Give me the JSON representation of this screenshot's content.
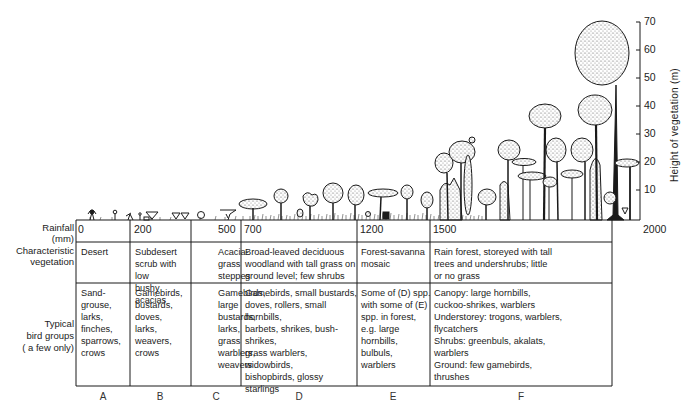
{
  "diagram": {
    "axis": {
      "title": "Height of vegetation (m)",
      "ticks": [
        "10",
        "20",
        "30",
        "40",
        "50",
        "60",
        "70"
      ],
      "unit": "m"
    },
    "row_labels": {
      "rainfall": "Rainfall\n(mm)",
      "vegetation": "Characteristic\nvegetation",
      "birds": "Typical\nbird groups\n( a few only)"
    },
    "rainfall_values": [
      "0",
      "200",
      "500",
      "700",
      "1200",
      "1500",
      "2000"
    ],
    "columns": [
      {
        "letter": "A",
        "vegetation": "Desert",
        "birds": "Sand-\ngrouse,\nlarks,\nfinches,\nsparrows,\ncrows"
      },
      {
        "letter": "B",
        "vegetation": "Subdesert\nscrub with low\nbushy acacias",
        "birds": "Gamebirds,\nbustards, doves,\nlarks, weavers,\ncrows"
      },
      {
        "letter": "C",
        "vegetation": "Acacia-\ngrass\nsteppes",
        "birds": "Gamebirds,\nlarge\nbustards,\nlarks,\ngrass\nwarblers,\nweavers"
      },
      {
        "letter": "D",
        "vegetation": "Broad-leaved deciduous\nwoodland with tall grass on\nground level; few shrubs",
        "birds": "Gamebirds, small bustards,\ndoves, rollers, small hornbills,\nbarbets, shrikes, bush-shrikes,\ngrass warblers, widowbirds,\nbishopbirds, glossy starlings"
      },
      {
        "letter": "E",
        "vegetation": "Forest-savanna\nmosaic",
        "birds": "Some of (D) spp.\nwith some of (E)\nspp. in forest,\ne.g. large hornbills,\nbulbuls,\nwarblers"
      },
      {
        "letter": "F",
        "vegetation": "Rain forest, storeyed with tall\ntrees and undershrubs; little\nor no grass",
        "birds": "Canopy: large hornbills,\ncuckoo-shrikes, warblers\nUnderstorey: trogons, warblers,\nflycatchers\nShrubs: greenbuls, akalats,\nwarblers\nGround: few gamebirds,\nthrushes"
      }
    ],
    "colors": {
      "ink": "#1a1a1a",
      "stipple": "#9a9a9a",
      "paper": "#ffffff"
    }
  }
}
